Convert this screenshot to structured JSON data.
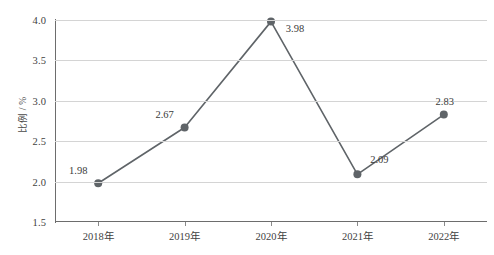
{
  "chart_data": {
    "type": "line",
    "title": "",
    "xlabel": "",
    "ylabel": "比例 / %",
    "categories": [
      "2018年",
      "2019年",
      "2020年",
      "2021年",
      "2022年"
    ],
    "values": [
      1.98,
      2.67,
      3.98,
      2.09,
      2.83
    ],
    "point_labels": [
      "1.98",
      "2.67",
      "3.98",
      "2.09",
      "2.83"
    ],
    "ylim": [
      1.5,
      4.0
    ],
    "yticks": [
      1.5,
      2.0,
      2.5,
      3.0,
      3.5,
      4.0
    ],
    "ytick_labels": [
      "1.5",
      "2.0",
      "2.5",
      "3.0",
      "3.5",
      "4.0"
    ],
    "grid": true,
    "legend": false,
    "series": [
      {
        "name": "比例 / %",
        "values": [
          1.98,
          2.67,
          3.98,
          2.09,
          2.83
        ]
      }
    ],
    "colors": {
      "line": "#5f6468",
      "marker": "#5f6468",
      "grid": "#d4d4d4",
      "axis": "#6d6d6d",
      "text": "#3a3a3a",
      "background": "#ffffff"
    },
    "label_offsets": [
      {
        "dx": -20,
        "dy": -13
      },
      {
        "dx": -20,
        "dy": -13
      },
      {
        "dx": 24,
        "dy": 6
      },
      {
        "dx": 22,
        "dy": -15
      },
      {
        "dx": 1,
        "dy": -14
      }
    ]
  }
}
